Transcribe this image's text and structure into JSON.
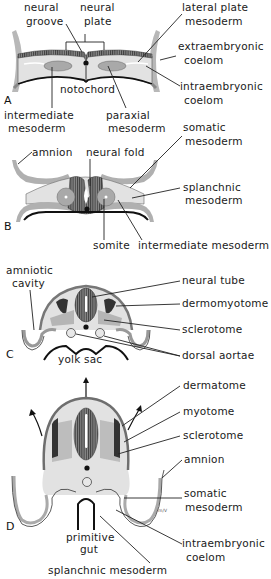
{
  "figure": {
    "colors": {
      "ectoderm": "#6e6e6e",
      "mesoderm_light": "#dcdcdc",
      "mesoderm_mid": "#a9a9a9",
      "neural": "#7a7a7a",
      "endoderm": "#111111",
      "background": "#ffffff"
    },
    "panels": [
      {
        "id": "A",
        "letter": "A",
        "labels": {
          "neural_groove": [
            "neural",
            "groove"
          ],
          "neural_plate": [
            "neural",
            "plate"
          ],
          "lateral_plate_mesoderm": [
            "lateral plate",
            "mesoderm"
          ],
          "extraembryonic_coelom": [
            "extraembryonic",
            "coelom"
          ],
          "notochord": [
            "notochord"
          ],
          "intraembryonic_coelom": [
            "intraembryonic",
            "coelom"
          ],
          "intermediate_mesoderm": [
            "intermediate",
            "mesoderm"
          ],
          "paraxial_mesoderm": [
            "paraxial",
            "mesoderm"
          ]
        }
      },
      {
        "id": "B",
        "letter": "B",
        "labels": {
          "amnion": [
            "amnion"
          ],
          "neural_fold": [
            "neural fold"
          ],
          "somatic_mesoderm": [
            "somatic",
            "mesoderm"
          ],
          "splanchnic_mesoderm": [
            "splanchnic",
            "mesoderm"
          ],
          "somite": [
            "somite"
          ],
          "intermediate_mesoderm": [
            "intermediate mesoderm"
          ]
        }
      },
      {
        "id": "C",
        "letter": "C",
        "labels": {
          "amniotic_cavity": [
            "amniotic",
            "cavity"
          ],
          "neural_tube": [
            "neural tube"
          ],
          "dermomyotome": [
            "dermomyotome"
          ],
          "sclerotome": [
            "sclerotome"
          ],
          "dorsal_aortae": [
            "dorsal aortae"
          ],
          "yolk_sac": [
            "yolk sac"
          ]
        }
      },
      {
        "id": "D",
        "letter": "D",
        "labels": {
          "dermatome": [
            "dermatome"
          ],
          "myotome": [
            "myotome"
          ],
          "sclerotome": [
            "sclerotome"
          ],
          "amnion": [
            "amnion"
          ],
          "somatic_mesoderm": [
            "somatic",
            "mesoderm"
          ],
          "intraembryonic_coelom": [
            "intraembryonic",
            "coelom"
          ],
          "primitive_gut": [
            "primitive",
            "gut"
          ],
          "splanchnic_mesoderm": [
            "splanchnic mesoderm"
          ]
        },
        "signature": "m/V"
      }
    ]
  }
}
